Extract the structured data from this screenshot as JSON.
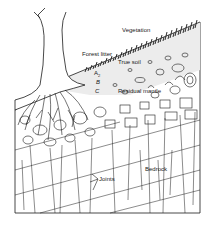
{
  "diagram": {
    "labels": {
      "vegetation": "Vegetation",
      "forest_litter": "Forest litter",
      "true_soil": "True soil",
      "horizon_a": "A",
      "horizon_a_sub": "2",
      "horizon_b": "B",
      "horizon_c": "C",
      "residual_mantle": "Residual mantle",
      "bedrock": "Bedrock",
      "joints": "Joints"
    },
    "colors": {
      "ink": "#1a1a1a",
      "background": "#ffffff",
      "soil_shade": "#e6e6e6"
    }
  }
}
